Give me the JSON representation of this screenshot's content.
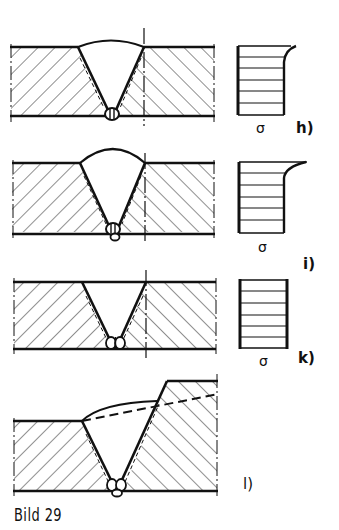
{
  "figure": {
    "caption": "Bild 29",
    "subfigures": [
      {
        "id": "h",
        "label": "h)",
        "stress_symbol": "σ",
        "weld": "V-butt weld with crown reinforcement",
        "stress_profile": "uniform with peak at top surface"
      },
      {
        "id": "i",
        "label": "i)",
        "stress_symbol": "σ",
        "weld": "V-butt weld with crown reinforcement",
        "stress_profile": "uniform with sharper peak at top surface"
      },
      {
        "id": "k",
        "label": "k)",
        "stress_symbol": "σ",
        "weld": "V-butt weld flush (no crown)",
        "stress_profile": "uniform"
      },
      {
        "id": "l",
        "label": "l)",
        "stress_symbol": "",
        "weld": "V-butt weld between plates of different thickness with transition"
      }
    ]
  },
  "colors": {
    "ink": "#111111",
    "background": "#ffffff"
  }
}
